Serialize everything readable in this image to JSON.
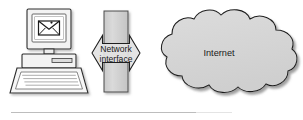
{
  "figure": {
    "type": "network-diagram",
    "background_color": "#ffffff",
    "shape_fill": "#d6d6d6",
    "shape_stroke": "#1a1a1a",
    "shadow_color": "#9a9a9a",
    "nodes": [
      {
        "id": "client-computer",
        "kind": "desktop-computer",
        "label": "",
        "screen_icon": "envelope-icon",
        "screen_icon_meaning": "email message"
      },
      {
        "id": "network-interface",
        "kind": "bidirectional-arrow-over-bar",
        "label_line_1": "Network",
        "label_line_2": "interface"
      },
      {
        "id": "internet-cloud",
        "kind": "cloud",
        "label": "Internet"
      }
    ],
    "connections": [
      {
        "from": "client-computer",
        "to": "internet-cloud",
        "via": "network-interface",
        "direction": "bidirectional"
      }
    ],
    "footer_rule": {
      "visible": true,
      "color": "#bdbdbd"
    }
  }
}
